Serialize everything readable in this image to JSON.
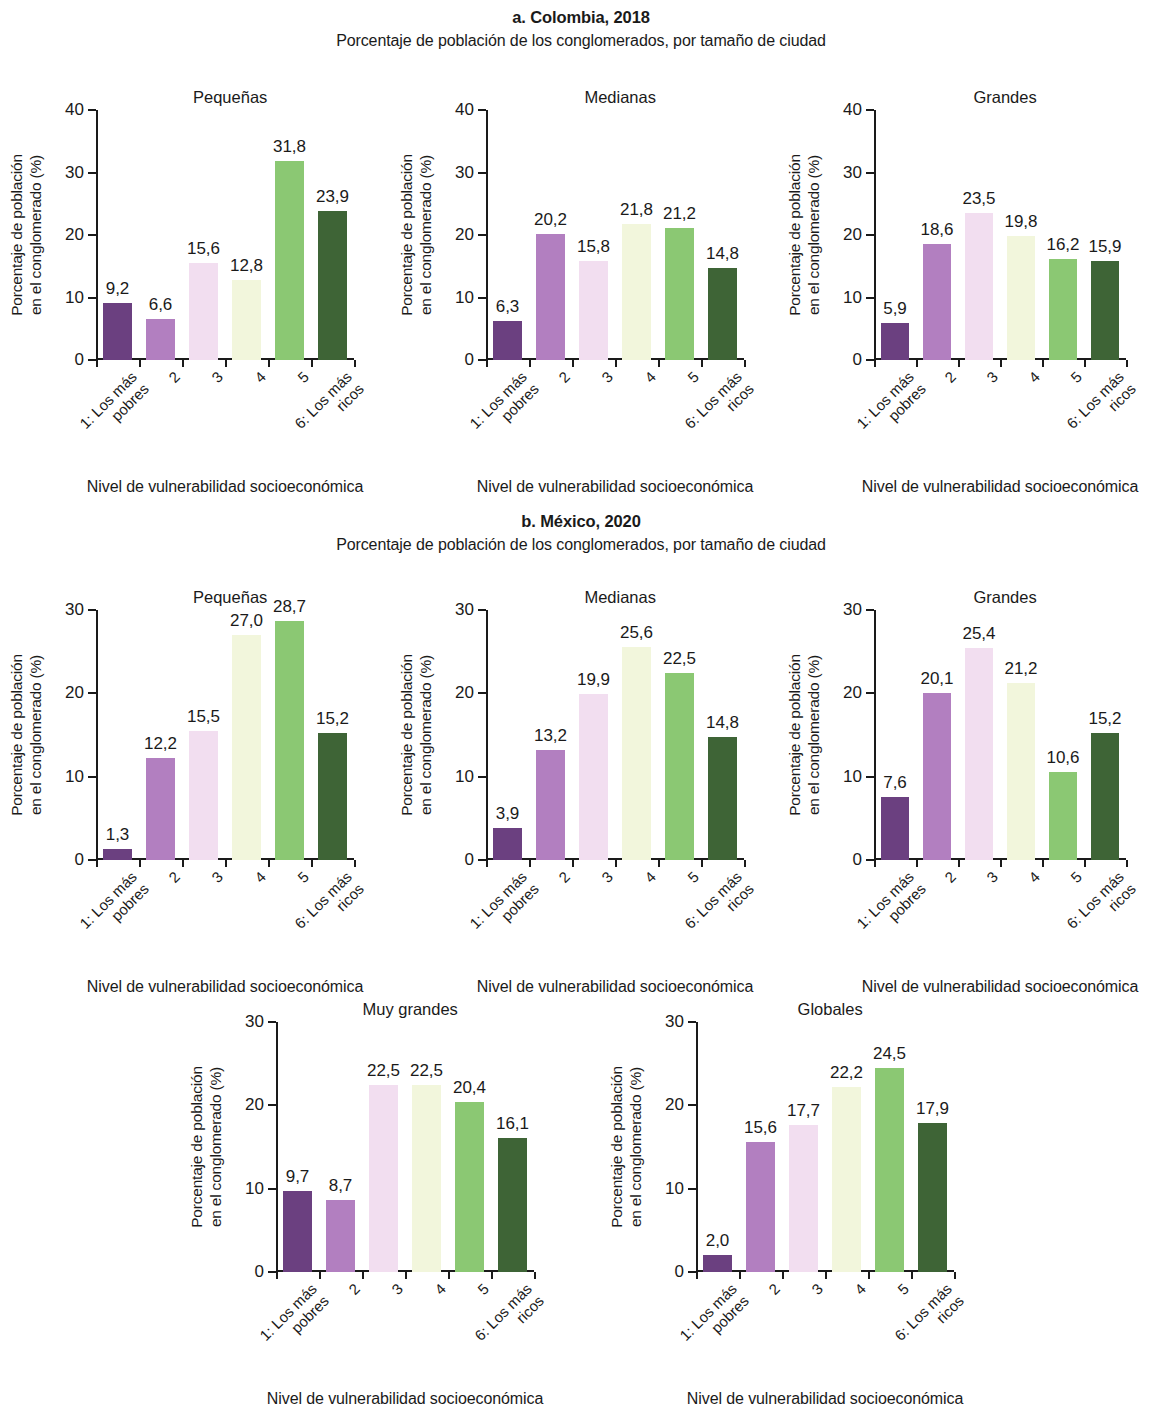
{
  "figure": {
    "panels": [
      {
        "id": "a",
        "title": "a. Colombia, 2018",
        "subtitle": "Porcentaje de población de los conglomerados, por tamaño de ciudad"
      },
      {
        "id": "b",
        "title": "b. México, 2020",
        "subtitle": "Porcentaje de población de los conglomerados, por tamaño de ciudad"
      }
    ],
    "axis_title_x": "Nivel de vulnerabilidad socioeconómica",
    "axis_title_y_line1": "Porcentaje de población",
    "axis_title_y_line2": "en el conglomerado (%)"
  },
  "colors": {
    "bar1": "#6B4080",
    "bar2": "#B27FC0",
    "bar3": "#F2DEF0",
    "bar4": "#F2F6DC",
    "bar5": "#8BC873",
    "bar6": "#3E6436",
    "axis": "#1a1a1a",
    "text": "#1a1a1a",
    "background": "#ffffff"
  },
  "chart_data": [
    {
      "type": "bar",
      "id": "colombia-pequenas",
      "panel": "a. Colombia, 2018",
      "title": "Pequeñas",
      "xlabel": "Nivel de vulnerabilidad socioeconómica",
      "ylabel": "Porcentaje de población en el conglomerado (%)",
      "categories": [
        "1: Los más pobres",
        "2",
        "3",
        "4",
        "5",
        "6: Los más ricos"
      ],
      "values": [
        9.2,
        6.6,
        15.6,
        12.8,
        31.8,
        23.9
      ],
      "labels": [
        "9,2",
        "6,6",
        "15,6",
        "12,8",
        "31,8",
        "23,9"
      ],
      "ylim": [
        0,
        40
      ],
      "yticks": [
        0,
        10,
        20,
        30,
        40
      ],
      "ytick_labels": [
        "0",
        "10",
        "20",
        "30",
        "40"
      ],
      "grid": false,
      "legend": "none"
    },
    {
      "type": "bar",
      "id": "colombia-medianas",
      "panel": "a. Colombia, 2018",
      "title": "Medianas",
      "xlabel": "Nivel de vulnerabilidad socioeconómica",
      "ylabel": "Porcentaje de población en el conglomerado (%)",
      "categories": [
        "1: Los más pobres",
        "2",
        "3",
        "4",
        "5",
        "6: Los más ricos"
      ],
      "values": [
        6.3,
        20.2,
        15.8,
        21.8,
        21.2,
        14.8
      ],
      "labels": [
        "6,3",
        "20,2",
        "15,8",
        "21,8",
        "21,2",
        "14,8"
      ],
      "ylim": [
        0,
        40
      ],
      "yticks": [
        0,
        10,
        20,
        30,
        40
      ],
      "ytick_labels": [
        "0",
        "10",
        "20",
        "30",
        "40"
      ],
      "grid": false,
      "legend": "none"
    },
    {
      "type": "bar",
      "id": "colombia-grandes",
      "panel": "a. Colombia, 2018",
      "title": "Grandes",
      "xlabel": "Nivel de vulnerabilidad socioeconómica",
      "ylabel": "Porcentaje de población en el conglomerado (%)",
      "categories": [
        "1: Los más pobres",
        "2",
        "3",
        "4",
        "5",
        "6: Los más ricos"
      ],
      "values": [
        5.9,
        18.6,
        23.5,
        19.8,
        16.2,
        15.9
      ],
      "labels": [
        "5,9",
        "18,6",
        "23,5",
        "19,8",
        "16,2",
        "15,9"
      ],
      "ylim": [
        0,
        40
      ],
      "yticks": [
        0,
        10,
        20,
        30,
        40
      ],
      "ytick_labels": [
        "0",
        "10",
        "20",
        "30",
        "40"
      ],
      "grid": false,
      "legend": "none"
    },
    {
      "type": "bar",
      "id": "mexico-pequenas",
      "panel": "b. México, 2020",
      "title": "Pequeñas",
      "xlabel": "Nivel de vulnerabilidad socioeconómica",
      "ylabel": "Porcentaje de población en el conglomerado (%)",
      "categories": [
        "1: Los más pobres",
        "2",
        "3",
        "4",
        "5",
        "6: Los más ricos"
      ],
      "values": [
        1.3,
        12.2,
        15.5,
        27.0,
        28.7,
        15.2
      ],
      "labels": [
        "1,3",
        "12,2",
        "15,5",
        "27,0",
        "28,7",
        "15,2"
      ],
      "ylim": [
        0,
        30
      ],
      "yticks": [
        0,
        10,
        20,
        30
      ],
      "ytick_labels": [
        "0",
        "10",
        "20",
        "30"
      ],
      "grid": false,
      "legend": "none"
    },
    {
      "type": "bar",
      "id": "mexico-medianas",
      "panel": "b. México, 2020",
      "title": "Medianas",
      "xlabel": "Nivel de vulnerabilidad socioeconómica",
      "ylabel": "Porcentaje de población en el conglomerado (%)",
      "categories": [
        "1: Los más pobres",
        "2",
        "3",
        "4",
        "5",
        "6: Los más ricos"
      ],
      "values": [
        3.9,
        13.2,
        19.9,
        25.6,
        22.5,
        14.8
      ],
      "labels": [
        "3,9",
        "13,2",
        "19,9",
        "25,6",
        "22,5",
        "14,8"
      ],
      "ylim": [
        0,
        30
      ],
      "yticks": [
        0,
        10,
        20,
        30
      ],
      "ytick_labels": [
        "0",
        "10",
        "20",
        "30"
      ],
      "grid": false,
      "legend": "none"
    },
    {
      "type": "bar",
      "id": "mexico-grandes",
      "panel": "b. México, 2020",
      "title": "Grandes",
      "xlabel": "Nivel de vulnerabilidad socioeconómica",
      "ylabel": "Porcentaje de población en el conglomerado (%)",
      "categories": [
        "1: Los más pobres",
        "2",
        "3",
        "4",
        "5",
        "6: Los más ricos"
      ],
      "values": [
        7.6,
        20.1,
        25.4,
        21.2,
        10.6,
        15.2
      ],
      "labels": [
        "7,6",
        "20,1",
        "25,4",
        "21,2",
        "10,6",
        "15,2"
      ],
      "ylim": [
        0,
        30
      ],
      "yticks": [
        0,
        10,
        20,
        30
      ],
      "ytick_labels": [
        "0",
        "10",
        "20",
        "30"
      ],
      "grid": false,
      "legend": "none"
    },
    {
      "type": "bar",
      "id": "mexico-muy-grandes",
      "panel": "b. México, 2020",
      "title": "Muy grandes",
      "xlabel": "Nivel de vulnerabilidad socioeconómica",
      "ylabel": "Porcentaje de población en el conglomerado (%)",
      "categories": [
        "1: Los más pobres",
        "2",
        "3",
        "4",
        "5",
        "6: Los más ricos"
      ],
      "values": [
        9.7,
        8.7,
        22.5,
        22.5,
        20.4,
        16.1
      ],
      "labels": [
        "9,7",
        "8,7",
        "22,5",
        "22,5",
        "20,4",
        "16,1"
      ],
      "ylim": [
        0,
        30
      ],
      "yticks": [
        0,
        10,
        20,
        30
      ],
      "ytick_labels": [
        "0",
        "10",
        "20",
        "30"
      ],
      "grid": false,
      "legend": "none"
    },
    {
      "type": "bar",
      "id": "mexico-globales",
      "panel": "b. México, 2020",
      "title": "Globales",
      "xlabel": "Nivel de vulnerabilidad socioeconómica",
      "ylabel": "Porcentaje de población en el conglomerado (%)",
      "categories": [
        "1: Los más pobres",
        "2",
        "3",
        "4",
        "5",
        "6: Los más ricos"
      ],
      "values": [
        2.0,
        15.6,
        17.7,
        22.2,
        24.5,
        17.9
      ],
      "labels": [
        "2,0",
        "15,6",
        "17,7",
        "22,2",
        "24,5",
        "17,9"
      ],
      "ylim": [
        0,
        30
      ],
      "yticks": [
        0,
        10,
        20,
        30
      ],
      "ytick_labels": [
        "0",
        "10",
        "20",
        "30"
      ],
      "grid": false,
      "legend": "none"
    }
  ]
}
